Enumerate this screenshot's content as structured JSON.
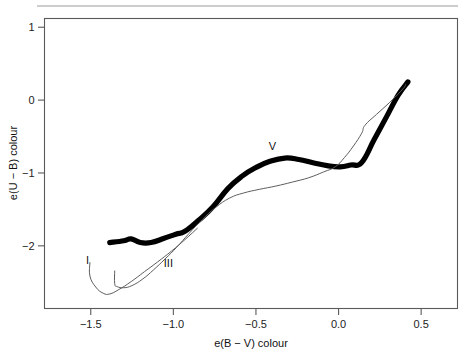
{
  "figure": {
    "background": "#ffffff",
    "frame_color": "#5a5a5a"
  },
  "axes": {
    "x_title": "e(B − V) colour",
    "y_title": "e(U − B) colour",
    "x_ticks": [
      "−1.5",
      "−1.0",
      "−0.5",
      "0.0",
      "0.5"
    ],
    "y_ticks": [
      "1",
      "0",
      "−1",
      "−2"
    ]
  },
  "labels": {
    "lum_I_right": "I",
    "lum_V": "V",
    "lum_III": "III",
    "lum_I_left": "I"
  },
  "chart_data": {
    "type": "line",
    "title": "",
    "xlabel": "e(B − V) colour",
    "ylabel": "e(U − B) colour",
    "xlim": [
      -1.78,
      0.72
    ],
    "ylim": [
      -2.86,
      1.12
    ],
    "grid": false,
    "legend": "inline-annotations",
    "x_tick_values": [
      -1.5,
      -1.0,
      -0.5,
      0.0,
      0.5
    ],
    "y_tick_values": [
      1,
      0,
      -1,
      -2
    ],
    "series": [
      {
        "name": "V",
        "annotation": "V",
        "annotation_at": [
          -0.4,
          -0.68
        ],
        "style": "thick-black",
        "color": "#000000",
        "linewidth": 5.2,
        "points": [
          [
            -1.385,
            -1.955
          ],
          [
            -1.3,
            -1.93
          ],
          [
            -1.255,
            -1.905
          ],
          [
            -1.2,
            -1.955
          ],
          [
            -1.135,
            -1.955
          ],
          [
            -1.06,
            -1.9
          ],
          [
            -0.985,
            -1.84
          ],
          [
            -0.93,
            -1.8
          ],
          [
            -0.845,
            -1.645
          ],
          [
            -0.76,
            -1.465
          ],
          [
            -0.67,
            -1.215
          ],
          [
            -0.585,
            -1.045
          ],
          [
            -0.5,
            -0.925
          ],
          [
            -0.415,
            -0.84
          ],
          [
            -0.325,
            -0.795
          ],
          [
            -0.24,
            -0.815
          ],
          [
            -0.155,
            -0.86
          ],
          [
            -0.07,
            -0.9
          ],
          [
            0.01,
            -0.915
          ],
          [
            0.075,
            -0.89
          ],
          [
            0.14,
            -0.855
          ],
          [
            0.215,
            -0.545
          ],
          [
            0.29,
            -0.23
          ],
          [
            0.36,
            0.065
          ],
          [
            0.42,
            0.25
          ]
        ]
      },
      {
        "name": "III",
        "annotation": "III",
        "annotation_at": [
          -1.03,
          -2.29
        ],
        "style": "thin-grey",
        "color": "#5e5e5e",
        "linewidth": 1.0,
        "points": [
          [
            -1.355,
            -2.345
          ],
          [
            -1.355,
            -2.52
          ],
          [
            -1.34,
            -2.56
          ],
          [
            -1.3,
            -2.575
          ],
          [
            -1.25,
            -2.545
          ],
          [
            -1.185,
            -2.455
          ],
          [
            -1.12,
            -2.33
          ],
          [
            -1.05,
            -2.18
          ],
          [
            -0.98,
            -2.02
          ],
          [
            -0.905,
            -1.83
          ],
          [
            -0.825,
            -1.64
          ],
          [
            -0.745,
            -1.475
          ],
          [
            -0.66,
            -1.345
          ],
          [
            -0.575,
            -1.275
          ],
          [
            -0.48,
            -1.225
          ],
          [
            -0.38,
            -1.18
          ],
          [
            -0.28,
            -1.125
          ],
          [
            -0.18,
            -1.065
          ],
          [
            -0.09,
            -0.985
          ],
          [
            -0.02,
            -0.915
          ],
          [
            0.035,
            -0.79
          ],
          [
            0.09,
            -0.63
          ],
          [
            0.14,
            -0.455
          ],
          [
            0.16,
            -0.345
          ],
          [
            0.23,
            -0.195
          ],
          [
            0.31,
            -0.03
          ],
          [
            0.39,
            0.155
          ],
          [
            0.405,
            0.215
          ]
        ]
      },
      {
        "name": "I",
        "annotation": "I",
        "annotation_at": [
          -1.52,
          -2.25
        ],
        "style": "thin-grey",
        "color": "#5e5e5e",
        "linewidth": 1.0,
        "points": [
          [
            -1.505,
            -2.23
          ],
          [
            -1.505,
            -2.415
          ],
          [
            -1.47,
            -2.565
          ],
          [
            -1.425,
            -2.65
          ],
          [
            -1.385,
            -2.66
          ],
          [
            -1.33,
            -2.6
          ],
          [
            -1.255,
            -2.49
          ],
          [
            -1.175,
            -2.355
          ],
          [
            -1.095,
            -2.22
          ],
          [
            -1.01,
            -2.07
          ],
          [
            -0.93,
            -1.915
          ],
          [
            -0.855,
            -1.76
          ]
        ]
      }
    ]
  }
}
